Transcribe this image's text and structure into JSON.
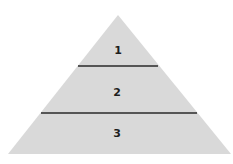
{
  "diagram": {
    "type": "pyramid",
    "colors": {
      "background": "#ffffff",
      "fill": "#d9d9d9",
      "divider": "#555555",
      "text": "#1e1e1e"
    },
    "geometry": {
      "apex": [
        118,
        15
      ],
      "base_left": [
        8,
        154
      ],
      "base_right": [
        231,
        154
      ],
      "dividers_y": [
        66,
        113
      ]
    },
    "levels": [
      {
        "label": "1"
      },
      {
        "label": "2"
      },
      {
        "label": "3"
      }
    ]
  }
}
